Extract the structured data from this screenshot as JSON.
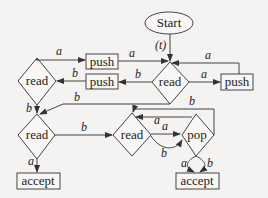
{
  "diagram": {
    "type": "flowchart",
    "nodes": {
      "start": {
        "label": "Start"
      },
      "read_top_right": {
        "label": "read"
      },
      "read_top_left": {
        "label": "read"
      },
      "push_top": {
        "label": "push"
      },
      "push_mid": {
        "label": "push"
      },
      "push_right": {
        "label": "push"
      },
      "read_bottom_left": {
        "label": "read"
      },
      "read_bottom_mid": {
        "label": "read"
      },
      "pop": {
        "label": "pop"
      },
      "accept_left": {
        "label": "accept"
      },
      "accept_right": {
        "label": "accept"
      }
    },
    "edge_labels": {
      "start_to_read": "(t)",
      "read_left_to_push_top": "a",
      "push_top_to_read": "a",
      "read_to_push_mid": "b",
      "push_mid_to_read_left": "b",
      "read_to_push_right": "a",
      "push_right_to_read": "a",
      "read_left_to_read_bottom": "b",
      "read_to_read_bottom": "b",
      "read_bottom_left_to_accept": "a",
      "read_bottom_left_to_read_mid": "b",
      "read_mid_to_pop_a": "a",
      "read_mid_to_pop_b": "b",
      "pop_to_read_mid_a": "a",
      "pop_to_read_mid_b": "b",
      "pop_to_accept_a": "a",
      "pop_to_accept_b": "b"
    }
  }
}
